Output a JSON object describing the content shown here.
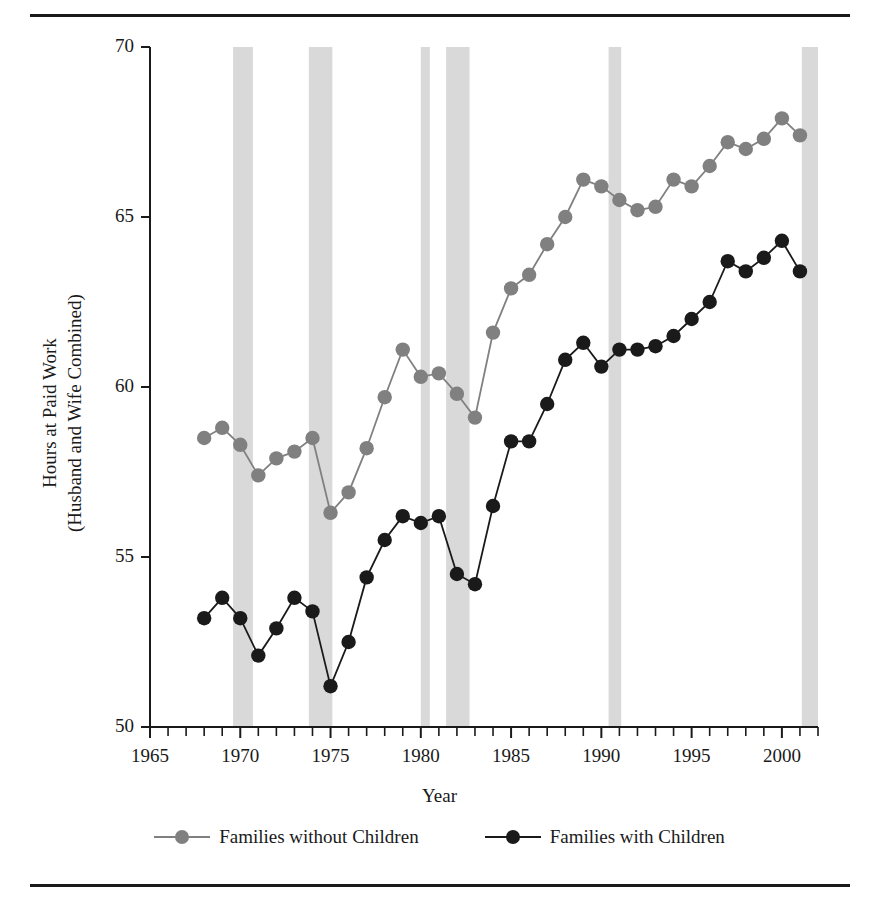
{
  "figure": {
    "rule_top": "horizontal-rule",
    "rule_bottom": "horizontal-rule"
  },
  "axes": {
    "y_title_line1": "Hours at Paid Work",
    "y_title_line2": "(Husband and Wife Combined)",
    "x_title": "Year",
    "y_ticks": [
      "50",
      "55",
      "60",
      "65",
      "70"
    ],
    "x_ticks": [
      "1965",
      "1970",
      "1975",
      "1980",
      "1985",
      "1990",
      "1995",
      "2000"
    ]
  },
  "legend": {
    "items": [
      {
        "label": "Families without Children",
        "color": "#808080"
      },
      {
        "label": "Families with Children",
        "color": "#1a1a1a"
      }
    ]
  },
  "colors": {
    "without_children": "#808080",
    "with_children": "#1a1a1a",
    "recession_band": "#d9d9d9",
    "axis": "#1a1a1a",
    "background": "#ffffff"
  },
  "chart_data": {
    "type": "line",
    "title": "",
    "xlabel": "Year",
    "ylabel": "Hours at Paid Work (Husband and Wife Combined)",
    "xlim": [
      1965,
      2002
    ],
    "ylim": [
      50,
      70
    ],
    "grid": false,
    "legend_position": "bottom",
    "x_tick_values": [
      1965,
      1970,
      1975,
      1980,
      1985,
      1990,
      1995,
      2000
    ],
    "y_tick_values": [
      50,
      55,
      60,
      65,
      70
    ],
    "minor_x_ticks_every": 1,
    "x": [
      1968,
      1969,
      1970,
      1971,
      1972,
      1973,
      1974,
      1975,
      1976,
      1977,
      1978,
      1979,
      1980,
      1981,
      1982,
      1983,
      1984,
      1985,
      1986,
      1987,
      1988,
      1989,
      1990,
      1991,
      1992,
      1993,
      1994,
      1995,
      1996,
      1997,
      1998,
      1999,
      2000,
      2001
    ],
    "series": [
      {
        "name": "Families without Children",
        "color": "#808080",
        "values": [
          58.5,
          58.8,
          58.3,
          57.4,
          57.9,
          58.1,
          58.5,
          56.3,
          56.9,
          58.2,
          59.7,
          61.1,
          60.3,
          60.4,
          59.8,
          59.1,
          61.6,
          62.9,
          63.3,
          64.2,
          65.0,
          66.1,
          65.9,
          65.5,
          65.2,
          65.3,
          66.1,
          65.9,
          66.5,
          67.2,
          67.0,
          67.3,
          67.9,
          67.4
        ]
      },
      {
        "name": "Families with Children",
        "color": "#1a1a1a",
        "values": [
          53.2,
          53.8,
          53.2,
          52.1,
          52.9,
          53.8,
          53.4,
          51.2,
          52.5,
          54.4,
          55.5,
          56.2,
          56.0,
          56.2,
          54.5,
          54.2,
          56.5,
          58.4,
          58.4,
          59.5,
          60.8,
          61.3,
          60.6,
          61.1,
          61.1,
          61.2,
          61.5,
          62.0,
          62.5,
          63.7,
          63.4,
          63.8,
          64.3,
          63.4
        ]
      }
    ],
    "recession_bands": [
      {
        "start": 1969.6,
        "end": 1970.7
      },
      {
        "start": 1973.8,
        "end": 1975.1
      },
      {
        "start": 1980.0,
        "end": 1980.5
      },
      {
        "start": 1981.4,
        "end": 1982.7
      },
      {
        "start": 1990.4,
        "end": 1991.1
      },
      {
        "start": 2001.1,
        "end": 2002.0
      }
    ]
  }
}
